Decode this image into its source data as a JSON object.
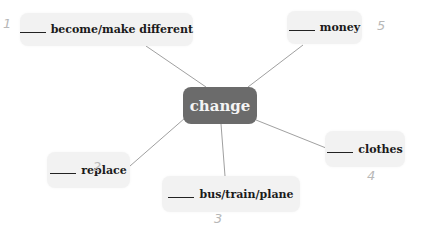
{
  "diagram": {
    "type": "mind-map",
    "center": {
      "label": "change",
      "color": "#6b6b6b",
      "text_color": "#f4f4f4"
    },
    "nodes": [
      {
        "id": 1,
        "blank": "____",
        "label": "become/make different",
        "hand_number": "1"
      },
      {
        "id": 2,
        "blank": "____",
        "label": "replace",
        "hand_number": "2"
      },
      {
        "id": 3,
        "blank": "____",
        "label": "bus/train/plane",
        "hand_number": "3"
      },
      {
        "id": 4,
        "blank": "____",
        "label": "clothes",
        "hand_number": "4"
      },
      {
        "id": 5,
        "blank": "____",
        "label": "money",
        "hand_number": "5"
      }
    ],
    "node_background": "#f2f2f2",
    "line_color": "#9a9a9a"
  }
}
